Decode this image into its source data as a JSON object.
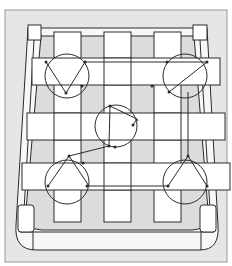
{
  "diagram": {
    "colors": {
      "background": "#ffffff",
      "panel": "#e6e6e6",
      "panel_border": "#9a9a9a",
      "seat": "#f7f7f7",
      "webbing": "#ffffff",
      "line": "#2a2a2a",
      "gap_shade": "#dcdcdc"
    },
    "springs": [
      {
        "id": "top-left",
        "cx": 67,
        "cy": 76,
        "r": 22
      },
      {
        "id": "top-right",
        "cx": 185,
        "cy": 76,
        "r": 22
      },
      {
        "id": "center",
        "cx": 116,
        "cy": 126,
        "r": 21
      },
      {
        "id": "bottom-left",
        "cx": 67,
        "cy": 182,
        "r": 22
      },
      {
        "id": "bottom-right",
        "cx": 185,
        "cy": 182,
        "r": 22
      }
    ],
    "webbing": {
      "vertical_count": 3,
      "horizontal_count": 3
    }
  }
}
